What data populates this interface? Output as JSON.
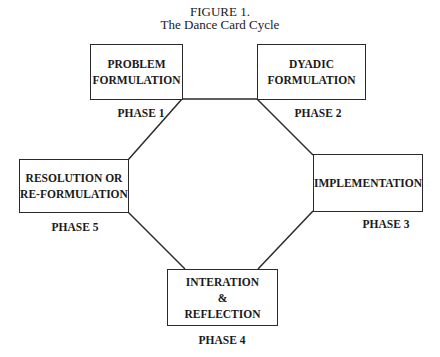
{
  "figure": {
    "number": "FIGURE 1.",
    "title": "The Dance Card Cycle"
  },
  "nodes": [
    {
      "id": "p1",
      "label_lines": [
        "PROBLEM",
        "FORMULATION"
      ],
      "phase": "PHASE 1"
    },
    {
      "id": "p2",
      "label_lines": [
        "DYADIC",
        "FORMULATION"
      ],
      "phase": "PHASE 2"
    },
    {
      "id": "p3",
      "label_lines": [
        "IMPLEMENTATION"
      ],
      "phase": "PHASE 3"
    },
    {
      "id": "p4",
      "label_lines": [
        "INTERATION",
        "&",
        "REFLECTION"
      ],
      "phase": "PHASE 4"
    },
    {
      "id": "p5",
      "label_lines": [
        "RESOLUTION OR",
        "RE-FORMULATION"
      ],
      "phase": "PHASE 5"
    }
  ],
  "edges": [
    {
      "from": "p1",
      "to": "p2"
    },
    {
      "from": "p2",
      "to": "p3"
    },
    {
      "from": "p3",
      "to": "p4"
    },
    {
      "from": "p4",
      "to": "p5"
    },
    {
      "from": "p5",
      "to": "p1"
    }
  ],
  "colors": {
    "line": "#2a2a2a",
    "background": "#ffffff"
  }
}
